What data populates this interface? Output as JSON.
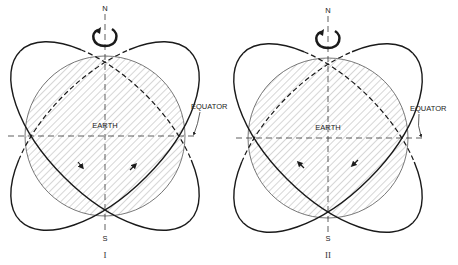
{
  "figure": {
    "panels": [
      {
        "id": "I",
        "label": "I",
        "north_label": "N",
        "south_label": "S",
        "earth_label": "EARTH",
        "equator_label": "EQUATOR",
        "rotation": "counterclockwise-arrow",
        "orbit_direction": "arrows pointing toward lower-right on left track and upper-right on right track"
      },
      {
        "id": "II",
        "label": "II",
        "north_label": "N",
        "south_label": "S",
        "earth_label": "EARTH",
        "equator_label": "EQUATOR",
        "rotation": "counterclockwise-arrow",
        "orbit_direction": "arrows pointing toward upper-left on left track and lower-left on right track"
      }
    ],
    "colors": {
      "line": "#1a1a1a",
      "hatch": "#8a8a8a",
      "background": "#ffffff"
    }
  }
}
